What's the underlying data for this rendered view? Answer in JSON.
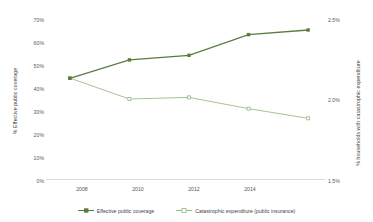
{
  "chart_data": {
    "type": "line",
    "title": "",
    "subtitle": "",
    "xlabel": "",
    "ylabel": "% Effective public coverage",
    "y2label": "% households with catastrophic expenditure",
    "x": [
      2008,
      2010,
      2012,
      2014,
      2016
    ],
    "xtick_labels": [
      "2008",
      "2010",
      "2012",
      "2014"
    ],
    "xtick_values": [
      2008,
      2010,
      2012,
      2014
    ],
    "xlim": [
      2007.2,
      2016.6
    ],
    "ylim": [
      0,
      70
    ],
    "ytick_labels": [
      "0%",
      "10%",
      "20%",
      "30%",
      "40%",
      "50%",
      "60%",
      "70%"
    ],
    "ytick_values": [
      0,
      10,
      20,
      30,
      40,
      50,
      60,
      70
    ],
    "y2lim": [
      1.5,
      2.5
    ],
    "y2tick_labels": [
      "1.5%",
      "2.0%",
      "2.5%"
    ],
    "y2tick_values": [
      1.5,
      2.0,
      2.5
    ],
    "grid": false,
    "legend_position": "bottom",
    "series": [
      {
        "name": "Effective public coverage",
        "axis": "left",
        "color": "#5d7b3d",
        "marker": "square",
        "values": [
          44,
          52,
          54,
          63,
          65
        ]
      },
      {
        "name": "Catastrophic expenditure (public insurance)",
        "axis": "right",
        "color": "#9bbb8a",
        "marker": "square",
        "values": [
          2.13,
          2.0,
          2.01,
          1.94,
          1.88
        ]
      }
    ]
  },
  "legend": {
    "items": [
      {
        "label": "Effective public coverage",
        "color": "#5d7b3d"
      },
      {
        "label": "Catastrophic expenditure (public insurance)",
        "color": "#9bbb8a"
      }
    ]
  },
  "axes": {
    "left_title": "% Effective public coverage",
    "right_title": "% households with catastrophic expenditure",
    "left_ticks": [
      "70%",
      "60%",
      "50%",
      "40%",
      "30%",
      "20%",
      "10%",
      "0%"
    ],
    "right_ticks": [
      "2.5%",
      "2.0%",
      "1.5%"
    ],
    "x_ticks": [
      "2008",
      "2010",
      "2012",
      "2014"
    ]
  },
  "colors": {
    "series_primary": "#5d7b3d",
    "series_secondary": "#9bbb8a",
    "axis_line": "#d4d4d4",
    "tick_text": "#58595b"
  }
}
